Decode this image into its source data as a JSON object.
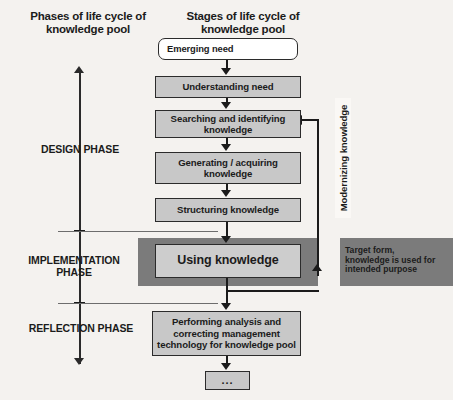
{
  "headers": {
    "phases": "Phases of life cycle of\nknowledge pool",
    "stages": "Stages of life cycle of\nknowledge pool"
  },
  "phases": [
    {
      "id": "design",
      "label": "DESIGN PHASE"
    },
    {
      "id": "implementation",
      "label": "IMPLEMENTATION\nPHASE"
    },
    {
      "id": "reflection",
      "label": "REFLECTION PHASE"
    }
  ],
  "stages": [
    {
      "id": "emerging",
      "label": "Emerging  need"
    },
    {
      "id": "understanding",
      "label": "Understanding need"
    },
    {
      "id": "searching",
      "label": "Searching and identifying\nknowledge"
    },
    {
      "id": "generating",
      "label": "Generating / acquiring\nknowledge"
    },
    {
      "id": "structuring",
      "label": "Structuring knowledge"
    },
    {
      "id": "using",
      "label": "Using knowledge"
    },
    {
      "id": "performing",
      "label": "Performing analysis and\ncorrecting management\ntechnology for knowledge pool"
    },
    {
      "id": "ellipsis",
      "label": "..."
    }
  ],
  "annotations": {
    "modernizing": "Modernizing knowledge",
    "target_form": "Target form,\nknowledge is used for\nintended purpose"
  },
  "colors": {
    "background": "#f4f2ef",
    "node_fill": "#c8c8c8",
    "node_border": "#2b2b2b",
    "band_fill": "#7b7b7b",
    "emerging_fill": "#ffffff",
    "connector": "#1b1b1b"
  }
}
